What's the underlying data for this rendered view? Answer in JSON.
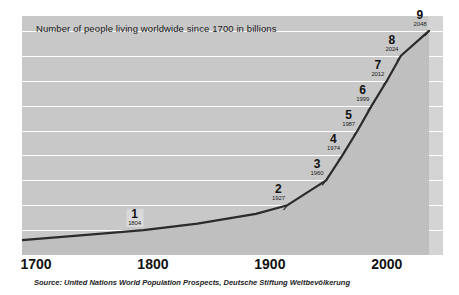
{
  "chart_data": {
    "type": "line",
    "title": "Number of people living worldwide since 1700 in billions",
    "xlabel": "",
    "ylabel": "",
    "xlim": [
      1700,
      2060
    ],
    "ylim": [
      0,
      9.6
    ],
    "grid": true,
    "legend": false,
    "x_ticks": [
      "1700",
      "1800",
      "1900",
      "2000"
    ],
    "x_tick_values": [
      1700,
      1800,
      1900,
      2000
    ],
    "y_gridlines": [
      1,
      2,
      3,
      4,
      5,
      6,
      7,
      8,
      9
    ],
    "series": [
      {
        "name": "World population (billions)",
        "x": [
          1700,
          1750,
          1804,
          1850,
          1900,
          1927,
          1960,
          1974,
          1987,
          1999,
          2012,
          2024,
          2048
        ],
        "values": [
          0.6,
          0.79,
          1,
          1.26,
          1.65,
          2,
          3,
          4,
          5,
          6,
          7,
          8,
          9
        ]
      }
    ],
    "milestones": [
      {
        "label": "1",
        "year": "1804",
        "value": 1,
        "boxed": true
      },
      {
        "label": "2",
        "year": "1927",
        "value": 2,
        "boxed": false
      },
      {
        "label": "3",
        "year": "1960",
        "value": 3,
        "boxed": false
      },
      {
        "label": "4",
        "year": "1974",
        "value": 4,
        "boxed": false
      },
      {
        "label": "5",
        "year": "1987",
        "value": 5,
        "boxed": false
      },
      {
        "label": "6",
        "year": "1999",
        "value": 6,
        "boxed": false
      },
      {
        "label": "7",
        "year": "2012",
        "value": 7,
        "boxed": false
      },
      {
        "label": "8",
        "year": "2024",
        "value": 8,
        "boxed": false
      },
      {
        "label": "9",
        "year": "2048",
        "value": 9,
        "boxed": false
      }
    ],
    "source": "Source: United Nations World Population Prospects, Deutsche Stiftung Weltbevölkerung",
    "colors": {
      "plot_background": "#c8c8c8",
      "right_band": "#d4d4d4",
      "gridline": "#ffffff",
      "line": "#2b2b2b",
      "text": "#111111",
      "page_background": "#ffffff"
    }
  }
}
